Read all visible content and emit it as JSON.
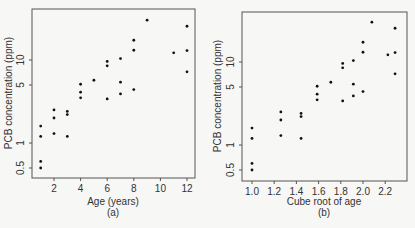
{
  "chart_data": [
    {
      "type": "scatter",
      "panel": "(a)",
      "title": "",
      "xlabel": "Age (years)",
      "ylabel": "PCB concentration (ppm)",
      "yscale": "log",
      "xlim": [
        0.3,
        12.6
      ],
      "ylim": [
        0.4,
        36
      ],
      "x_ticks": [
        2,
        4,
        6,
        8,
        10,
        12
      ],
      "y_ticks": [
        0.5,
        1,
        5,
        10
      ],
      "grid": false,
      "points": [
        {
          "x": 1,
          "y": 1.6
        },
        {
          "x": 1,
          "y": 1.2
        },
        {
          "x": 1,
          "y": 0.6
        },
        {
          "x": 1,
          "y": 0.5
        },
        {
          "x": 2,
          "y": 2.5
        },
        {
          "x": 2,
          "y": 2.0
        },
        {
          "x": 2,
          "y": 1.3
        },
        {
          "x": 3,
          "y": 2.4
        },
        {
          "x": 3,
          "y": 2.2
        },
        {
          "x": 3,
          "y": 1.2
        },
        {
          "x": 4,
          "y": 5.1
        },
        {
          "x": 4,
          "y": 4.1
        },
        {
          "x": 4,
          "y": 3.5
        },
        {
          "x": 5,
          "y": 5.7
        },
        {
          "x": 6,
          "y": 9.6
        },
        {
          "x": 6,
          "y": 8.5
        },
        {
          "x": 6,
          "y": 3.4
        },
        {
          "x": 7,
          "y": 10.4
        },
        {
          "x": 7,
          "y": 5.4
        },
        {
          "x": 7,
          "y": 3.9
        },
        {
          "x": 8,
          "y": 17.3
        },
        {
          "x": 8,
          "y": 13.1
        },
        {
          "x": 8,
          "y": 4.4
        },
        {
          "x": 9,
          "y": 30.2
        },
        {
          "x": 11,
          "y": 12.2
        },
        {
          "x": 12,
          "y": 25.5
        },
        {
          "x": 12,
          "y": 13.0
        },
        {
          "x": 12,
          "y": 7.2
        }
      ]
    },
    {
      "type": "scatter",
      "panel": "(b)",
      "title": "",
      "xlabel": "Cube root of age",
      "ylabel": "PCB concentration (ppm)",
      "yscale": "log",
      "xlim": [
        0.93,
        2.35
      ],
      "ylim": [
        0.4,
        36
      ],
      "x_ticks": [
        1.0,
        1.2,
        1.4,
        1.6,
        1.8,
        2.0,
        2.2
      ],
      "y_ticks": [
        0.5,
        1,
        5,
        10
      ],
      "grid": false,
      "points": [
        {
          "x": 1.0,
          "y": 1.6
        },
        {
          "x": 1.0,
          "y": 1.2
        },
        {
          "x": 1.0,
          "y": 0.6
        },
        {
          "x": 1.0,
          "y": 0.5
        },
        {
          "x": 1.26,
          "y": 2.5
        },
        {
          "x": 1.26,
          "y": 2.0
        },
        {
          "x": 1.26,
          "y": 1.3
        },
        {
          "x": 1.442,
          "y": 2.4
        },
        {
          "x": 1.442,
          "y": 2.2
        },
        {
          "x": 1.442,
          "y": 1.2
        },
        {
          "x": 1.587,
          "y": 5.1
        },
        {
          "x": 1.587,
          "y": 4.1
        },
        {
          "x": 1.587,
          "y": 3.5
        },
        {
          "x": 1.71,
          "y": 5.7
        },
        {
          "x": 1.817,
          "y": 9.6
        },
        {
          "x": 1.817,
          "y": 8.5
        },
        {
          "x": 1.817,
          "y": 3.4
        },
        {
          "x": 1.913,
          "y": 10.4
        },
        {
          "x": 1.913,
          "y": 5.4
        },
        {
          "x": 1.913,
          "y": 3.9
        },
        {
          "x": 2.0,
          "y": 17.3
        },
        {
          "x": 2.0,
          "y": 13.1
        },
        {
          "x": 2.0,
          "y": 4.4
        },
        {
          "x": 2.08,
          "y": 30.2
        },
        {
          "x": 2.224,
          "y": 12.2
        },
        {
          "x": 2.289,
          "y": 25.5
        },
        {
          "x": 2.289,
          "y": 13.0
        },
        {
          "x": 2.289,
          "y": 7.2
        }
      ]
    }
  ],
  "panels": [
    {
      "caption": "(a)",
      "xlabel": "Age (years)",
      "ylabel": "PCB concentration (ppm)",
      "x_tick_labels": [
        "2",
        "4",
        "6",
        "8",
        "10",
        "12"
      ],
      "y_tick_labels": [
        "0.5",
        "1",
        "5",
        "10"
      ]
    },
    {
      "caption": "(b)",
      "xlabel": "Cube root of age",
      "ylabel": "PCB concentration (ppm)",
      "x_tick_labels": [
        "1.0",
        "1.2",
        "1.4",
        "1.6",
        "1.8",
        "2.0",
        "2.2"
      ],
      "y_tick_labels": [
        "0.5",
        "1",
        "5",
        "10"
      ]
    }
  ]
}
